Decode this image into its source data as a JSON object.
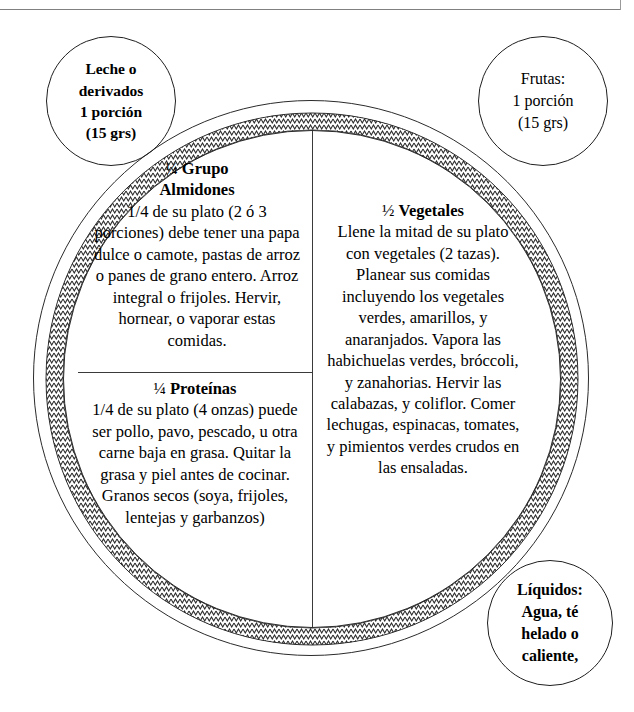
{
  "document": {
    "title": "Plato Saludable — Guía de Porciones",
    "language": "es"
  },
  "plate": {
    "rim_pattern": "zigzag-hatch",
    "rim_color": "#2b2b2b",
    "background_color": "#ffffff",
    "sectors": [
      {
        "id": "almidones",
        "fraction": "¼",
        "heading": "Grupo Almidones",
        "heading_line1_fraction": "¼ ",
        "heading_line1_word": "Grupo",
        "heading_line2_word": "Almidones",
        "body": "1/4 de su plato (2 ó 3 porciones) debe tener una papa dulce o camote, pastas de arroz o panes de grano entero. Arroz integral o frijoles. Hervir, hornear, o vaporar estas comidas."
      },
      {
        "id": "proteinas",
        "fraction": "¼",
        "heading": "Proteínas",
        "heading_line1_fraction": "¼ ",
        "heading_line1_word": "Proteínas",
        "body": "1/4 de su plato (4 onzas) puede ser pollo, pavo, pescado, u otra carne baja en grasa. Quitar la grasa  y piel antes de cocinar. Granos secos (soya, frijoles, lentejas y garbanzos)"
      },
      {
        "id": "vegetales",
        "fraction": "½",
        "heading": "Vegetales",
        "heading_line1_fraction": "½ ",
        "heading_line1_word": "Vegetales",
        "body": "Llene la mitad de su plato con vegetales (2 tazas). Planear sus comidas incluyendo los vegetales verdes, amarillos, y anaranjados.  Vapora las habichuelas verdes, bróccoli, y zanahorias. Hervir las calabazas, y coliflor.  Comer lechugas, espinacas, tomates, y pimientos verdes crudos en las ensaladas."
      }
    ]
  },
  "bubbles": [
    {
      "id": "dairy",
      "bold": true,
      "lines": [
        "Leche o",
        "derivados",
        "1 porción",
        "(15 grs)"
      ],
      "text": "Leche o derivados 1 porción (15 grs)"
    },
    {
      "id": "fruits",
      "bold": false,
      "lines": [
        "Frutas:",
        "1 porción",
        "(15 grs)"
      ],
      "text": "Frutas: 1 porción (15 grs)"
    },
    {
      "id": "liquids",
      "bold": true,
      "lines": [
        "Líquidos:",
        "Agua, té",
        "helado o",
        "caliente,"
      ],
      "text": "Líquidos: Agua, té helado o caliente,"
    }
  ]
}
